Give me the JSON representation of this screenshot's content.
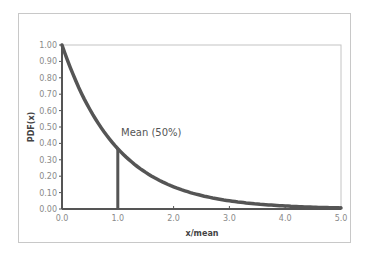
{
  "chart_data": {
    "type": "line",
    "title": "",
    "xlabel": "x/mean",
    "ylabel": "PDF(x)",
    "xlim": [
      0,
      5
    ],
    "ylim": [
      0,
      1
    ],
    "x_ticks": [
      "0.0",
      "1.0",
      "2.0",
      "3.0",
      "4.0",
      "5.0"
    ],
    "y_ticks": [
      "0.00",
      "0.10",
      "0.20",
      "0.30",
      "0.40",
      "0.50",
      "0.60",
      "0.70",
      "0.80",
      "0.90",
      "1.00"
    ],
    "grid": false,
    "legend": null,
    "series": [
      {
        "name": "Exponential PDF",
        "x": [
          0.0,
          0.25,
          0.5,
          0.75,
          1.0,
          1.5,
          2.0,
          2.5,
          3.0,
          3.5,
          4.0,
          4.5,
          5.0
        ],
        "values": [
          1.0,
          0.78,
          0.61,
          0.47,
          0.37,
          0.22,
          0.14,
          0.08,
          0.05,
          0.03,
          0.02,
          0.01,
          0.01
        ],
        "color": "#555555"
      }
    ],
    "annotations": [
      {
        "text": "Mean (50%)",
        "x": 1.0,
        "y": 0.37,
        "type": "vertical-line"
      }
    ]
  },
  "labels": {
    "annotation": "Mean (50%)",
    "xlabel": "x/mean",
    "ylabel": "PDF(x)"
  }
}
